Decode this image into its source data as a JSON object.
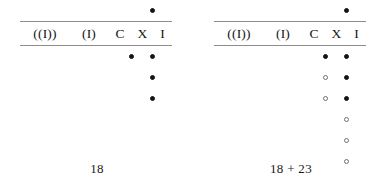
{
  "figure": {
    "type": "abacus-place-value-diagram",
    "column_headers": [
      "((I))",
      "(I)",
      "C",
      "X",
      "I"
    ],
    "column_keys": [
      "MM",
      "M",
      "C",
      "X",
      "I"
    ],
    "dot_states": {
      "filled": "filled",
      "open": "open",
      "empty": "empty"
    },
    "colors": {
      "background": "#ffffff",
      "ink": "#151515",
      "rule": "#8c8c8c",
      "open_dot_stroke": "#6f6f6f"
    }
  },
  "panels": [
    {
      "id": "panel-left",
      "caption": "18",
      "columns": [
        {
          "key": "MM",
          "header": "((I))",
          "upper": [],
          "lower": []
        },
        {
          "key": "M",
          "header": "(I)",
          "upper": [],
          "lower": []
        },
        {
          "key": "C",
          "header": "C",
          "upper": [],
          "lower": []
        },
        {
          "key": "X",
          "header": "X",
          "upper": [],
          "lower": [
            "filled"
          ]
        },
        {
          "key": "I",
          "header": "I",
          "upper": [
            "filled"
          ],
          "lower": [
            "filled",
            "filled",
            "filled"
          ]
        }
      ]
    },
    {
      "id": "panel-right",
      "caption": "18 + 23",
      "columns": [
        {
          "key": "MM",
          "header": "((I))",
          "upper": [],
          "lower": []
        },
        {
          "key": "M",
          "header": "(I)",
          "upper": [],
          "lower": []
        },
        {
          "key": "C",
          "header": "C",
          "upper": [],
          "lower": []
        },
        {
          "key": "X",
          "header": "X",
          "upper": [],
          "lower": [
            "filled",
            "open",
            "open"
          ]
        },
        {
          "key": "I",
          "header": "I",
          "upper": [
            "filled"
          ],
          "lower": [
            "filled",
            "filled",
            "filled",
            "open",
            "open",
            "open"
          ]
        }
      ]
    }
  ]
}
